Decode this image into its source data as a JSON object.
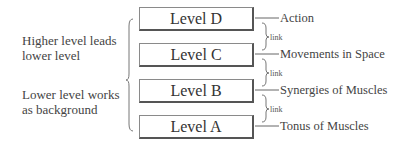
{
  "left_notes": [
    {
      "line1": "Higher level leads",
      "line2": "lower level"
    },
    {
      "line1": "Lower level works",
      "line2": "as background"
    }
  ],
  "levels": [
    {
      "label": "Level D",
      "description": "Action"
    },
    {
      "label": "Level C",
      "description": "Movements in Space"
    },
    {
      "label": "Level B",
      "description": "Synergies of Muscles"
    },
    {
      "label": "Level A",
      "description": "Tonus of Muscles"
    }
  ],
  "links": [
    "link",
    "link",
    "link"
  ],
  "colors": {
    "box_border": "#555555",
    "text": "#333333",
    "line": "#666666"
  }
}
